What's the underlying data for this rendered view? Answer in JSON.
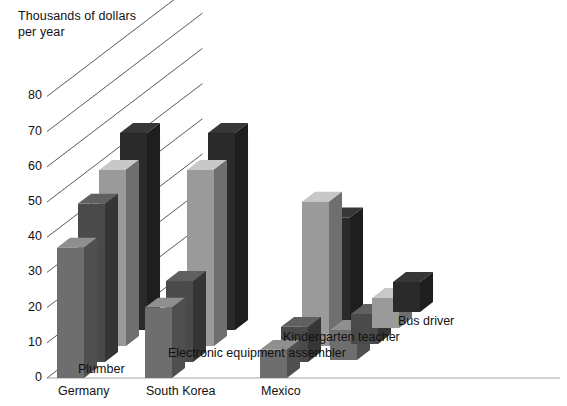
{
  "chart_data": {
    "type": "bar",
    "title": "",
    "subtitle": "",
    "ylabel": "Thousands of dollars\nper year",
    "xlabel": "",
    "ylim": [
      0,
      85
    ],
    "yticks": [
      0,
      10,
      20,
      30,
      40,
      50,
      60,
      70,
      80
    ],
    "grid": true,
    "grid_style": "diagonal-depth",
    "legend_position": "right-diagonal",
    "projection": "3d-grouped-bars",
    "categories": [
      "Germany",
      "South Korea",
      "Mexico"
    ],
    "series": [
      {
        "name": "Plumber",
        "color": "#6e6e6e",
        "values": [
          37,
          20,
          8
        ]
      },
      {
        "name": "Electronic equipment assembler",
        "color": "#4a4a4a",
        "values": [
          45,
          23,
          10
        ]
      },
      {
        "name": "Kindergarten teacher",
        "color": "#9a9a9a",
        "values": [
          50,
          50,
          41
        ]
      },
      {
        "name": "Bus driver",
        "color": "#2a2a2a",
        "values": [
          56,
          56,
          32
        ]
      }
    ]
  },
  "axis": {
    "title_text": "Thousands of dollars\nper year",
    "tick_labels": [
      "0",
      "10",
      "20",
      "30",
      "40",
      "50",
      "60",
      "70",
      "80"
    ]
  },
  "categories": {
    "items": [
      {
        "label": "Germany"
      },
      {
        "label": "South Korea"
      },
      {
        "label": "Mexico"
      }
    ]
  },
  "legend": {
    "items": [
      {
        "label": "Bus driver",
        "color": "#2a2a2a"
      },
      {
        "label": "Kindergarten teacher",
        "color": "#9a9a9a"
      },
      {
        "label": "Electronic equipment assembler",
        "color": "#4a4a4a"
      },
      {
        "label": "Plumber",
        "color": "#6e6e6e"
      }
    ]
  },
  "colors": {
    "background": "#ffffff",
    "text": "#111111",
    "gridline": "#3b3b3b",
    "plumber": "#6e6e6e",
    "electronic": "#4a4a4a",
    "kindergarten": "#9a9a9a",
    "busdriver": "#2a2a2a"
  }
}
